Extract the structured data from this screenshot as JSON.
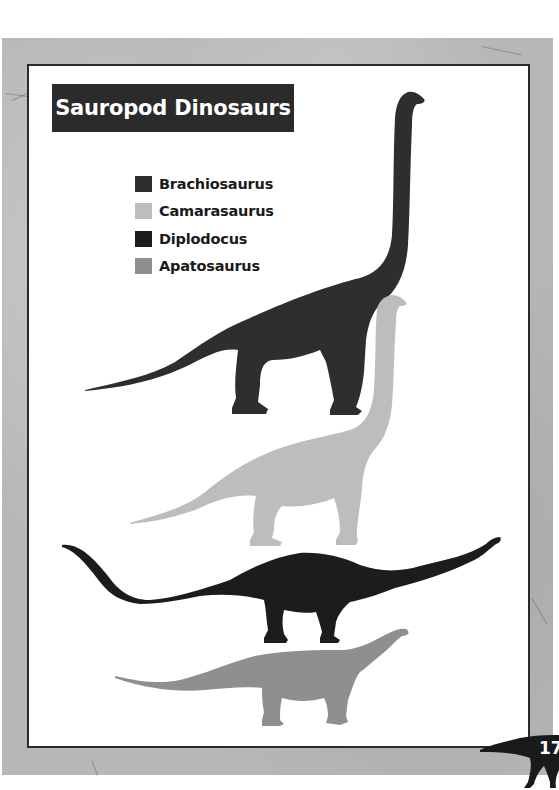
{
  "page": {
    "title": "Sauropod Dinosaurs",
    "page_number": "17"
  },
  "legend": {
    "items": [
      {
        "label": "Brachiosaurus",
        "color": "#2e2e2e"
      },
      {
        "label": "Camarasaurus",
        "color": "#bdbdbd"
      },
      {
        "label": "Diplodocus",
        "color": "#1c1c1c"
      },
      {
        "label": "Apatosaurus",
        "color": "#8f8f8f"
      }
    ]
  },
  "silhouettes": [
    {
      "name": "Brachiosaurus",
      "color": "#2e2e2e"
    },
    {
      "name": "Camarasaurus",
      "color": "#bdbdbd"
    },
    {
      "name": "Diplodocus",
      "color": "#1c1c1c"
    },
    {
      "name": "Apatosaurus",
      "color": "#8f8f8f"
    }
  ],
  "colors": {
    "frame_stone": "#b7b7b7",
    "panel_border": "#2a2a2a",
    "title_bg": "#2b2b2b",
    "title_text": "#ffffff"
  }
}
